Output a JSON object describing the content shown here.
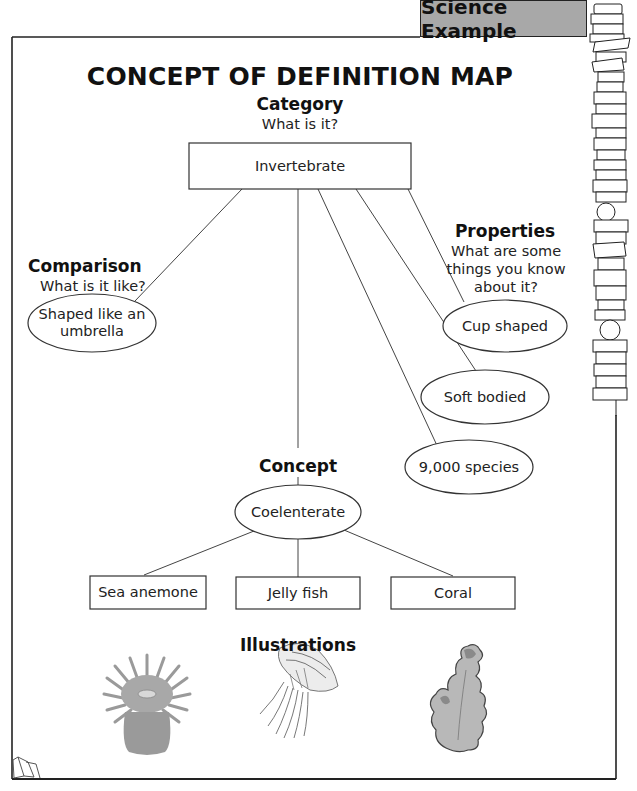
{
  "banner": {
    "label": "Science Example"
  },
  "title": "CONCEPT OF DEFINITION MAP",
  "category": {
    "heading": "Category",
    "question": "What is it?",
    "value": "Invertebrate"
  },
  "comparison": {
    "heading": "Comparison",
    "question": "What is it like?",
    "value": "Shaped like an umbrella"
  },
  "properties": {
    "heading": "Properties",
    "question_lines": [
      "What are some",
      "things you know",
      "about it?"
    ],
    "items": [
      "Cup shaped",
      "Soft bodied",
      "9,000 species"
    ]
  },
  "concept": {
    "heading": "Concept",
    "value": "Coelenterate"
  },
  "examples": [
    "Sea anemone",
    "Jelly fish",
    "Coral"
  ],
  "illustrations": {
    "heading": "Illustrations",
    "icons": [
      "sea-anemone-illustration",
      "jellyfish-illustration",
      "coral-illustration"
    ]
  },
  "decor": {
    "book_stack_icon": "book-stack-icon",
    "open_book_icon": "open-book-icon"
  },
  "colors": {
    "banner_bg": "#a8a8a8",
    "line": "#333333",
    "illustration_gray": "#9a9a9a"
  }
}
